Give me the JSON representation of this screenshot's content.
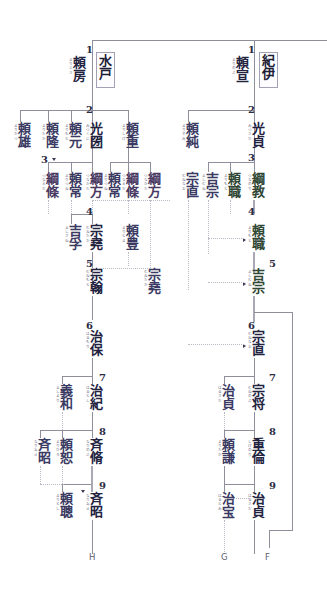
{
  "chart": {
    "type": "genealogy-tree",
    "colors": {
      "line": "#8f8f9c",
      "dotted_line": "#b9b9c4",
      "ink": "#3a3a63",
      "box_border": "#a2a2b4"
    }
  },
  "domains": {
    "mito": {
      "label": "水戸"
    },
    "kii": {
      "label": "紀伊"
    }
  },
  "ordinals": {
    "n1": "1",
    "n2": "2",
    "n3": "3",
    "n4": "4",
    "n5": "5",
    "n6": "6",
    "n7": "7",
    "n8": "8",
    "n9": "9"
  },
  "markers": {
    "h": "H",
    "g": "G",
    "f": "F"
  },
  "mito": {
    "gen1": [
      {
        "name": "頼房",
        "yomi": "よりふさ",
        "ordinal": "1"
      }
    ],
    "gen2": [
      {
        "name": "頼雄",
        "yomi": "よりかつ"
      },
      {
        "name": "頼隆",
        "yomi": "よりたか"
      },
      {
        "name": "頼元",
        "yomi": "よりもと"
      },
      {
        "name": "光圀",
        "yomi": "みつくに",
        "ordinal": "2"
      },
      {
        "name": "頼重",
        "yomi": "よりしげ"
      }
    ],
    "gen3": [
      {
        "name": "綱條",
        "yomi": "つなえだ",
        "ordinal": "3"
      },
      {
        "name": "頼常",
        "yomi": "よりつね"
      },
      {
        "name": "綱方",
        "yomi": "つなかた"
      },
      {
        "name": "頼常",
        "yomi": "よりつね"
      },
      {
        "name": "綱條",
        "yomi": "つなえだ"
      },
      {
        "name": "綱方",
        "yomi": "つなかた"
      }
    ],
    "gen4": [
      {
        "name": "吉孚",
        "yomi": "よしざね"
      },
      {
        "name": "宗堯",
        "yomi": "むねたか",
        "ordinal": "4"
      },
      {
        "name": "頼豊",
        "yomi": "よりとよ"
      }
    ],
    "gen5": [
      {
        "name": "宗翰",
        "yomi": "むねもと",
        "ordinal": "5"
      },
      {
        "name": "宗堯",
        "yomi": "むねたか"
      }
    ],
    "gen6": [
      {
        "name": "治保",
        "yomi": "はるもり",
        "ordinal": "6"
      }
    ],
    "gen7": [
      {
        "name": "義和",
        "yomi": "よしより"
      },
      {
        "name": "治紀",
        "yomi": "はるとし",
        "ordinal": "7"
      }
    ],
    "gen8": [
      {
        "name": "斉昭",
        "yomi": "なりあき"
      },
      {
        "name": "頼恕",
        "yomi": "よりひろ"
      },
      {
        "name": "斉脩",
        "yomi": "なりのぶ",
        "ordinal": "8"
      }
    ],
    "gen9": [
      {
        "name": "頼聰",
        "yomi": "よりとし"
      },
      {
        "name": "斉昭",
        "yomi": "なりあき",
        "ordinal": "9"
      }
    ]
  },
  "kii": {
    "gen1": [
      {
        "name": "頼宣",
        "yomi": "よりのぶ",
        "ordinal": "1"
      }
    ],
    "gen2": [
      {
        "name": "頼純",
        "yomi": "よりずみ"
      },
      {
        "name": "光貞",
        "yomi": "みつさだ",
        "ordinal": "2"
      }
    ],
    "gen3": [
      {
        "name": "宗直",
        "yomi": "むねなお"
      },
      {
        "name": "吉宗",
        "yomi": "よしむね"
      },
      {
        "name": "頼職",
        "yomi": "よりもと"
      },
      {
        "name": "綱教",
        "yomi": "つなのり",
        "ordinal": "3"
      }
    ],
    "gen4": [
      {
        "name": "頼職",
        "yomi": "よりもと",
        "ordinal": "4"
      }
    ],
    "gen5": [
      {
        "name": "吉宗",
        "yomi": "よしむね",
        "ordinal": "5"
      }
    ],
    "gen6": [
      {
        "name": "宗直",
        "yomi": "むねなお",
        "ordinal": "6"
      }
    ],
    "gen7": [
      {
        "name": "治貞",
        "yomi": "はるさだ"
      },
      {
        "name": "宗将",
        "yomi": "むねのぶ",
        "ordinal": "7"
      }
    ],
    "gen8": [
      {
        "name": "頼謙",
        "yomi": "よりたか"
      },
      {
        "name": "重倫",
        "yomi": "しげのり",
        "ordinal": "8"
      }
    ],
    "gen9": [
      {
        "name": "治宝",
        "yomi": "はるとみ"
      },
      {
        "name": "治貞",
        "yomi": "はるさだ",
        "ordinal": "9"
      }
    ]
  }
}
